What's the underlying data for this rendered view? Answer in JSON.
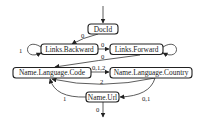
{
  "diagram": {
    "type": "state-transition-graph",
    "nodes": [
      {
        "id": "docid",
        "label": "DocId"
      },
      {
        "id": "links_backward",
        "label": "Links.Backward"
      },
      {
        "id": "links_forward",
        "label": "Links.Forward"
      },
      {
        "id": "name_language_code",
        "label": "Name.Language.Code"
      },
      {
        "id": "name_language_country",
        "label": "Name.Language.Country"
      },
      {
        "id": "name_url",
        "label": "Name.Url"
      }
    ],
    "edges": [
      {
        "from": "start",
        "to": "docid",
        "label": ""
      },
      {
        "from": "docid",
        "to": "links_backward",
        "label": "0"
      },
      {
        "from": "links_backward",
        "to": "links_backward",
        "label": "1"
      },
      {
        "from": "links_backward",
        "to": "links_forward",
        "label": "0"
      },
      {
        "from": "links_forward",
        "to": "links_forward",
        "label": ""
      },
      {
        "from": "links_forward",
        "to": "name_language_code",
        "label": "0"
      },
      {
        "from": "name_language_code",
        "to": "name_language_country",
        "label": "0,1,2"
      },
      {
        "from": "name_language_country",
        "to": "name_language_code",
        "label": "2"
      },
      {
        "from": "name_url",
        "to": "name_language_code",
        "label": "1"
      },
      {
        "from": "name_language_country",
        "to": "name_url",
        "label": "0,1"
      },
      {
        "from": "name_url",
        "to": "end",
        "label": "0"
      }
    ]
  }
}
